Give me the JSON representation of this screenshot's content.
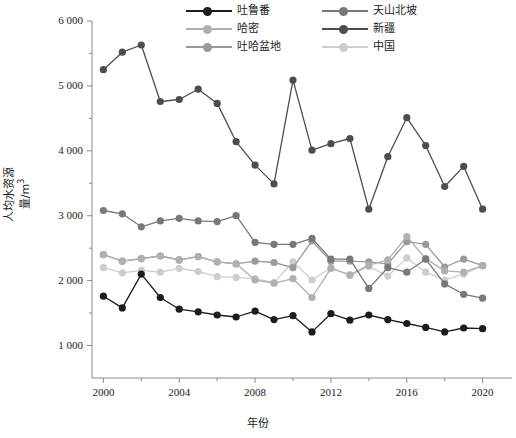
{
  "chart_data": {
    "type": "line",
    "title": "",
    "xlabel": "年份",
    "ylabel": "人均水资源量/m³",
    "x": [
      2000,
      2001,
      2002,
      2003,
      2004,
      2005,
      2006,
      2007,
      2008,
      2009,
      2010,
      2011,
      2012,
      2013,
      2014,
      2015,
      2016,
      2017,
      2018,
      2019,
      2020
    ],
    "xlim": [
      1999.4,
      2020.6
    ],
    "ylim": [
      500,
      6000
    ],
    "xticks_major": [
      2000,
      2004,
      2008,
      2012,
      2016,
      2020
    ],
    "xticks_minor": [
      2002,
      2006,
      2010,
      2014,
      2018
    ],
    "xtick_labels": [
      "2000",
      "2004",
      "2008",
      "2012",
      "2016",
      "2020"
    ],
    "yticks_major": [
      1000,
      2000,
      3000,
      4000,
      5000,
      6000
    ],
    "ytick_labels": [
      "1 000",
      "2 000",
      "3 000",
      "4 000",
      "5 000",
      "6 000"
    ],
    "yticks_minor": [
      1500,
      2500,
      3500,
      4500,
      5500
    ],
    "grid": false,
    "legend_position": "top-right",
    "series": [
      {
        "name": "吐鲁番",
        "color": "#1c1c1c",
        "values": [
          1760,
          1580,
          2100,
          1740,
          1560,
          1520,
          1470,
          1440,
          1530,
          1400,
          1460,
          1210,
          1490,
          1390,
          1470,
          1400,
          1340,
          1280,
          1210,
          1270,
          1260
        ]
      },
      {
        "name": "哈密",
        "color": "#b0b0b0",
        "values": [
          2400,
          2300,
          2340,
          2380,
          2320,
          2370,
          2290,
          2260,
          2010,
          1960,
          2030,
          1740,
          2190,
          2090,
          2240,
          2320,
          2680,
          2340,
          2150,
          2130,
          2230
        ]
      },
      {
        "name": "吐哈盆地",
        "color": "#9a9a9a",
        "values": [
          2400,
          2300,
          2340,
          2380,
          2320,
          2370,
          2290,
          2260,
          2300,
          2280,
          2200,
          2610,
          2300,
          2300,
          2290,
          2260,
          2600,
          2560,
          2210,
          2330,
          2230
        ]
      },
      {
        "name": "天山北坡",
        "color": "#787878",
        "values": [
          3080,
          3030,
          2830,
          2920,
          2960,
          2920,
          2910,
          3000,
          2590,
          2560,
          2560,
          2650,
          2330,
          2330,
          1880,
          2200,
          2130,
          2330,
          1950,
          1790,
          1730
        ]
      },
      {
        "name": "新疆",
        "color": "#4d4d4d",
        "values": [
          5250,
          5520,
          5630,
          4760,
          4790,
          4950,
          4730,
          4140,
          3780,
          3490,
          5090,
          4010,
          4110,
          4190,
          3100,
          3910,
          4510,
          4080,
          3450,
          3760,
          3100
        ]
      },
      {
        "name": "中国",
        "color": "#cdcdcd",
        "values": [
          2200,
          2120,
          2160,
          2130,
          2190,
          2140,
          2060,
          2050,
          2030,
          1970,
          2290,
          2010,
          2200,
          2080,
          2220,
          2070,
          2350,
          2130,
          2010,
          2100,
          2230
        ]
      }
    ]
  },
  "legend": {
    "entries": [
      {
        "label": "吐鲁番",
        "color": "#1c1c1c",
        "col": 0,
        "row": 0
      },
      {
        "label": "天山北坡",
        "color": "#787878",
        "col": 1,
        "row": 0
      },
      {
        "label": "哈密",
        "color": "#b0b0b0",
        "col": 0,
        "row": 1
      },
      {
        "label": "新疆",
        "color": "#4d4d4d",
        "col": 1,
        "row": 1
      },
      {
        "label": "吐哈盆地",
        "color": "#9a9a9a",
        "col": 0,
        "row": 2
      },
      {
        "label": "中国",
        "color": "#cdcdcd",
        "col": 1,
        "row": 2
      }
    ]
  },
  "axes": {
    "axis_color": "#8c8c8c",
    "plot_left": 92,
    "plot_right": 494,
    "plot_top": 21,
    "plot_bottom": 378
  }
}
